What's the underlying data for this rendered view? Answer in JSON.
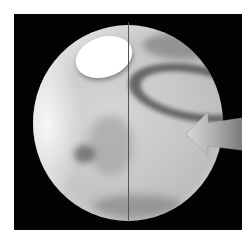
{
  "image": {
    "subject": "planet-disc",
    "features": [
      "polar-cap",
      "dark-albedo-markings",
      "central-meridian-line",
      "pointer-arrow"
    ],
    "colors": {
      "background": "#ffffff",
      "frame": "#030303",
      "disc": "#c8c8c8",
      "polar_cap": "#ffffff",
      "meridian": "#555555",
      "arrow": "#a8a8a8"
    }
  }
}
